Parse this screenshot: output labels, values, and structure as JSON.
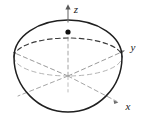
{
  "figure": {
    "type": "3d-solid-diagram",
    "background_color": "#ffffff",
    "outline_color": "#1a1a1a",
    "hidden_line_color": "#8a8a8a",
    "axis_color": "#6e6e6e",
    "point_color": "#111111"
  },
  "axes": [
    {
      "id": "z",
      "label": "z",
      "label_x": 76,
      "label_y": 12,
      "direction": "up",
      "style": "solid-above-origin, dashed-inside-solid",
      "arrow": true
    },
    {
      "id": "y",
      "label": "y",
      "label_x": 133,
      "label_y": 50,
      "direction": "up-right",
      "style": "dashed",
      "arrow": true
    },
    {
      "id": "x",
      "label": "x",
      "label_x": 128,
      "label_y": 110,
      "direction": "down-right",
      "style": "dashed",
      "arrow": true
    }
  ],
  "origin": {
    "x": 68,
    "y": 76
  },
  "point": {
    "name": "marked-point",
    "x": 68,
    "y": 32,
    "radius": 2.6,
    "on_axis": "z"
  },
  "dome": {
    "center_x": 68,
    "center_y": 76,
    "radius_x": 54,
    "top_y": 20,
    "bottom_y": 112
  },
  "equator": {
    "center_x": 68,
    "center_y": 57,
    "radius_x": 54,
    "radius_y": 19,
    "back_arc_style": "dashed-dark",
    "front_arc_style": "dashed-light"
  }
}
